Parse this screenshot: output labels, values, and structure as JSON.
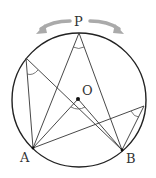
{
  "diagram": {
    "labels": {
      "P": "P",
      "O": "O",
      "A": "A",
      "B": "B"
    },
    "colors": {
      "stroke": "#222222",
      "arrow": "#aaaaaa",
      "background": "#ffffff"
    }
  }
}
